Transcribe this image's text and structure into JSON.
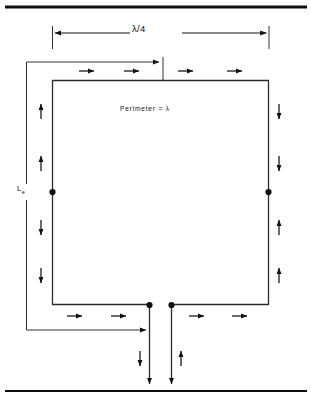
{
  "figure": {
    "kind": "loop-antenna-current-distribution-diagram",
    "labels": {
      "quarter_wave": "λ/4",
      "perimeter": "Perimeter = λ",
      "effective_length_main": "L",
      "effective_length_sub": "e"
    },
    "colors": {
      "ink": "#111111",
      "rule": "#0d0d0d",
      "outline": "#2b2b2b",
      "background": "#ffffff"
    },
    "rules": [
      {
        "name": "top-rule",
        "y": 7,
        "x1": 5,
        "x2": 307,
        "thickness": 3.2
      },
      {
        "name": "bottom-rule",
        "y": 391,
        "x1": 5,
        "x2": 307,
        "thickness": 2.2
      }
    ],
    "dimension_lambda_quarter": {
      "y": 33,
      "x_left": 52,
      "x_right": 269,
      "tick_top": 26,
      "tick_bottom": 49,
      "arrowheads": "both-inward"
    },
    "loop": {
      "left": 52,
      "right": 269,
      "top": 80,
      "bottom": 305,
      "stroke": 1.3
    },
    "feed": {
      "left_line_x": 149,
      "right_line_x": 171,
      "top_y": 305,
      "bottom_y": 388
    },
    "nodes": [
      {
        "name": "left-current-node",
        "x": 52,
        "y": 192
      },
      {
        "name": "right-current-node",
        "x": 269,
        "y": 192
      },
      {
        "name": "feed-terminal-left",
        "x": 149,
        "y": 305
      },
      {
        "name": "feed-terminal-right",
        "x": 171,
        "y": 305
      }
    ],
    "le_bracket": {
      "x": 26,
      "y_top": 62,
      "y_bottom": 330,
      "gap_top": 184,
      "gap_bottom": 200,
      "top_lead_x_end": 162,
      "bottom_lead_x_end": 149,
      "top_tick_x": 163,
      "top_tick_y1": 57,
      "top_tick_y2": 80
    },
    "current_arrows": [
      {
        "name": "arrow-top-1",
        "x": 87,
        "y": 71,
        "dir": "right"
      },
      {
        "name": "arrow-top-2",
        "x": 131,
        "y": 71,
        "dir": "right"
      },
      {
        "name": "arrow-top-3",
        "x": 186,
        "y": 71,
        "dir": "right"
      },
      {
        "name": "arrow-top-4",
        "x": 234,
        "y": 71,
        "dir": "right"
      },
      {
        "name": "arrow-left-up-1",
        "x": 41,
        "y": 111,
        "dir": "up"
      },
      {
        "name": "arrow-left-up-2",
        "x": 41,
        "y": 163,
        "dir": "up"
      },
      {
        "name": "arrow-left-down-1",
        "x": 41,
        "y": 228,
        "dir": "down"
      },
      {
        "name": "arrow-left-down-2",
        "x": 41,
        "y": 276,
        "dir": "down"
      },
      {
        "name": "arrow-right-down-1",
        "x": 279,
        "y": 111,
        "dir": "down"
      },
      {
        "name": "arrow-right-down-2",
        "x": 279,
        "y": 163,
        "dir": "down"
      },
      {
        "name": "arrow-right-up-1",
        "x": 279,
        "y": 228,
        "dir": "up"
      },
      {
        "name": "arrow-right-up-2",
        "x": 279,
        "y": 276,
        "dir": "up"
      },
      {
        "name": "arrow-bottom-left-1",
        "x": 75,
        "y": 316,
        "dir": "right"
      },
      {
        "name": "arrow-bottom-left-2",
        "x": 118,
        "y": 316,
        "dir": "right"
      },
      {
        "name": "arrow-bottom-right-1",
        "x": 196,
        "y": 316,
        "dir": "right"
      },
      {
        "name": "arrow-bottom-right-2",
        "x": 239,
        "y": 316,
        "dir": "right"
      },
      {
        "name": "arrow-feed-left-down",
        "x": 140,
        "y": 359,
        "dir": "down"
      },
      {
        "name": "arrow-feed-right-up",
        "x": 181,
        "y": 359,
        "dir": "up"
      }
    ]
  }
}
